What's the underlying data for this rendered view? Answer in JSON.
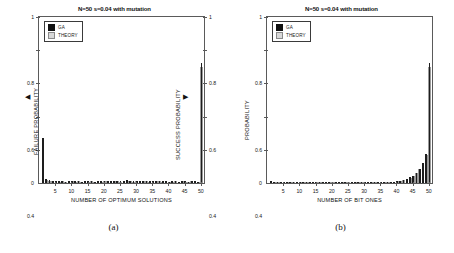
{
  "figure": {
    "panels": [
      {
        "id": "a",
        "caption": "(a)",
        "title": "N=50 s=0.04 with mutation",
        "legend": [
          {
            "key": "ga",
            "label": "GA"
          },
          {
            "key": "theory",
            "label": "THEORY"
          }
        ],
        "xlabel": "NUMBER OF OPTIMUM SOLUTIONS",
        "left_axis_label": "FAILURE PROBABILITY",
        "right_axis_label": "SUCCESS PROBABILITY",
        "left_arrow": "◀",
        "right_arrow": "▶",
        "origin_label": "0",
        "yticks": [
          "0.2",
          "0.4",
          "0.6",
          "0.8",
          "1"
        ],
        "yticks_right": [
          "0.2",
          "0.4",
          "0.6",
          "0.8",
          "1"
        ],
        "xticks": [
          "5",
          "10",
          "15",
          "20",
          "25",
          "30",
          "35",
          "40",
          "45",
          "50"
        ]
      },
      {
        "id": "b",
        "caption": "(b)",
        "title": "N=50 s=0.04 with mutation",
        "legend": [
          {
            "key": "ga",
            "label": "GA"
          },
          {
            "key": "theory",
            "label": "THEORY"
          }
        ],
        "xlabel": "NUMBER OF BIT ONES",
        "left_axis_label": "PROBABILITY",
        "origin_label": "0",
        "yticks": [
          "0.2",
          "0.4",
          "0.6",
          "0.8",
          "1"
        ],
        "xticks": [
          "5",
          "10",
          "15",
          "20",
          "25",
          "30",
          "35",
          "40",
          "45",
          "50"
        ]
      }
    ]
  },
  "chart_data": [
    {
      "type": "bar",
      "panel": "a",
      "title": "N=50 s=0.04 with mutation",
      "xlabel": "NUMBER OF OPTIMUM SOLUTIONS",
      "ylabel": "FAILURE PROBABILITY",
      "ylabel_right": "SUCCESS PROBABILITY",
      "xlim": [
        0,
        51
      ],
      "ylim": [
        0,
        1
      ],
      "yticks": [
        0.2,
        0.4,
        0.6,
        0.8,
        1
      ],
      "xticks": [
        5,
        10,
        15,
        20,
        25,
        30,
        35,
        40,
        45,
        50
      ],
      "grid": false,
      "legend": [
        "GA",
        "THEORY"
      ],
      "legend_position": "top-left",
      "x": [
        1,
        2,
        3,
        4,
        5,
        6,
        7,
        8,
        9,
        10,
        11,
        12,
        13,
        14,
        15,
        16,
        17,
        18,
        19,
        20,
        21,
        22,
        23,
        24,
        25,
        26,
        27,
        28,
        29,
        30,
        31,
        32,
        33,
        34,
        35,
        36,
        37,
        38,
        39,
        40,
        41,
        42,
        43,
        44,
        45,
        46,
        47,
        48,
        49,
        50
      ],
      "series": [
        {
          "name": "GA",
          "values": [
            0.27,
            0.022,
            0.016,
            0.012,
            0.013,
            0.01,
            0.013,
            0.009,
            0.012,
            0.011,
            0.01,
            0.014,
            0.009,
            0.012,
            0.01,
            0.013,
            0.009,
            0.011,
            0.01,
            0.013,
            0.012,
            0.01,
            0.014,
            0.011,
            0.01,
            0.013,
            0.016,
            0.012,
            0.01,
            0.014,
            0.013,
            0.011,
            0.015,
            0.01,
            0.012,
            0.011,
            0.013,
            0.01,
            0.012,
            0.009,
            0.01,
            0.011,
            0.009,
            0.012,
            0.01,
            0.009,
            0.011,
            0.01,
            0.009,
            0.72
          ]
        },
        {
          "name": "THEORY",
          "values": [
            0.26,
            0.02,
            0.015,
            0.011,
            0.012,
            0.009,
            0.012,
            0.008,
            0.011,
            0.01,
            0.009,
            0.013,
            0.008,
            0.011,
            0.009,
            0.012,
            0.008,
            0.01,
            0.009,
            0.012,
            0.011,
            0.009,
            0.013,
            0.01,
            0.009,
            0.012,
            0.015,
            0.011,
            0.009,
            0.013,
            0.012,
            0.01,
            0.014,
            0.009,
            0.011,
            0.01,
            0.012,
            0.009,
            0.011,
            0.008,
            0.009,
            0.01,
            0.008,
            0.011,
            0.009,
            0.008,
            0.01,
            0.009,
            0.008,
            0.7
          ]
        }
      ]
    },
    {
      "type": "bar",
      "panel": "b",
      "title": "N=50 s=0.04 with mutation",
      "xlabel": "NUMBER OF BIT ONES",
      "ylabel": "PROBABILITY",
      "xlim": [
        0,
        51
      ],
      "ylim": [
        0,
        1
      ],
      "yticks": [
        0.2,
        0.4,
        0.6,
        0.8,
        1
      ],
      "xticks": [
        5,
        10,
        15,
        20,
        25,
        30,
        35,
        40,
        45,
        50
      ],
      "grid": false,
      "legend": [
        "GA",
        "THEORY"
      ],
      "legend_position": "top-left",
      "x": [
        1,
        2,
        3,
        4,
        5,
        6,
        7,
        8,
        9,
        10,
        11,
        12,
        13,
        14,
        15,
        16,
        17,
        18,
        19,
        20,
        21,
        22,
        23,
        24,
        25,
        26,
        27,
        28,
        29,
        30,
        31,
        32,
        33,
        34,
        35,
        36,
        37,
        38,
        39,
        40,
        41,
        42,
        43,
        44,
        45,
        46,
        47,
        48,
        49,
        50
      ],
      "series": [
        {
          "name": "GA",
          "values": [
            0.012,
            0.002,
            0.002,
            0.002,
            0.002,
            0.002,
            0.002,
            0.002,
            0.002,
            0.002,
            0.002,
            0.002,
            0.002,
            0.002,
            0.002,
            0.002,
            0.002,
            0.002,
            0.002,
            0.002,
            0.002,
            0.002,
            0.003,
            0.003,
            0.003,
            0.003,
            0.003,
            0.003,
            0.004,
            0.004,
            0.004,
            0.004,
            0.005,
            0.005,
            0.006,
            0.006,
            0.007,
            0.008,
            0.009,
            0.012,
            0.015,
            0.02,
            0.026,
            0.034,
            0.045,
            0.062,
            0.085,
            0.12,
            0.175,
            0.72
          ]
        },
        {
          "name": "THEORY",
          "values": [
            0.01,
            0.002,
            0.002,
            0.002,
            0.002,
            0.002,
            0.002,
            0.002,
            0.002,
            0.002,
            0.002,
            0.002,
            0.002,
            0.002,
            0.002,
            0.002,
            0.002,
            0.002,
            0.002,
            0.002,
            0.002,
            0.002,
            0.003,
            0.003,
            0.003,
            0.003,
            0.003,
            0.003,
            0.004,
            0.004,
            0.004,
            0.004,
            0.005,
            0.005,
            0.006,
            0.006,
            0.007,
            0.008,
            0.009,
            0.011,
            0.014,
            0.019,
            0.025,
            0.032,
            0.043,
            0.06,
            0.082,
            0.115,
            0.17,
            0.7
          ]
        }
      ]
    }
  ]
}
